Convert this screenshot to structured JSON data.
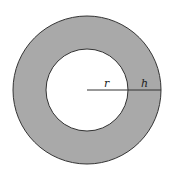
{
  "diagram": {
    "labels": {
      "inner_radius": "r",
      "thickness": "h"
    },
    "colors": {
      "ring_fill": "#a9a9a9",
      "stroke": "#333333",
      "inner_fill": "#ffffff"
    },
    "geometry": {
      "cx": 87,
      "cy": 90,
      "outer_r": 74,
      "inner_r": 41
    }
  }
}
